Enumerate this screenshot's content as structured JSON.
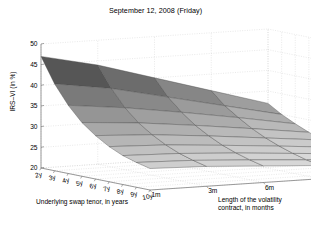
{
  "figure": {
    "title": "September 12, 2008 (Friday)",
    "background": "#ffffff",
    "axis_color": "#808080",
    "grid_color": "#c8c8c8"
  },
  "axes": {
    "y": {
      "label": "IRS–VI (in %)",
      "ticks": [
        "20",
        "25",
        "30",
        "35",
        "40",
        "45",
        "50"
      ],
      "min": 20,
      "max": 50
    },
    "x": {
      "label": "Underlying swap tenor, in years",
      "ticks": [
        "2y",
        "3y",
        "4y",
        "5y",
        "6y",
        "7y",
        "8y",
        "9y",
        "10y"
      ]
    },
    "z": {
      "label_line1": "Length of the volatility",
      "label_line2": "contract, in months",
      "ticks": [
        "1m",
        "3m",
        "6m",
        "9m",
        "12m"
      ]
    }
  },
  "chart_data": {
    "type": "surface",
    "title": "September 12, 2008 (Friday)",
    "xlabel": "Underlying swap tenor, in years",
    "zlabel": "Length of the volatility contract, in months",
    "ylabel": "IRS–VI (in %)",
    "ylim": [
      20,
      50
    ],
    "grid": true,
    "legend": "none",
    "colormap": "gray",
    "x_categories": [
      "2y",
      "3y",
      "4y",
      "5y",
      "6y",
      "7y",
      "8y",
      "9y",
      "10y"
    ],
    "z_categories": [
      "1m",
      "3m",
      "6m",
      "9m",
      "12m"
    ],
    "values": [
      [
        47.0,
        41.0,
        36.5,
        33.0,
        30.5,
        28.5,
        27.0,
        26.0,
        25.2
      ],
      [
        44.0,
        39.0,
        35.0,
        32.0,
        29.8,
        28.0,
        26.6,
        25.6,
        24.8
      ],
      [
        40.0,
        36.0,
        33.0,
        30.5,
        28.6,
        27.0,
        25.8,
        24.8,
        24.0
      ],
      [
        36.0,
        33.0,
        30.8,
        28.8,
        27.2,
        25.9,
        24.8,
        23.9,
        23.2
      ],
      [
        32.0,
        30.0,
        28.4,
        27.0,
        25.8,
        24.7,
        23.8,
        23.0,
        22.4
      ]
    ]
  }
}
